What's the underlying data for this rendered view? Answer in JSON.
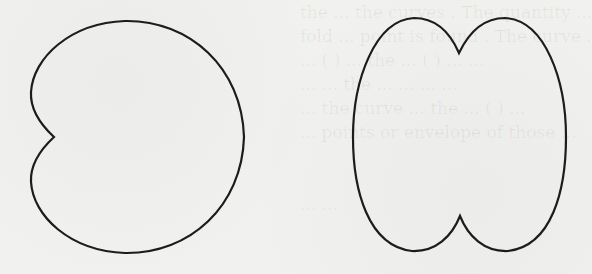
{
  "figure": {
    "background_color": "#f1f1f0",
    "stroke_color": "#1c1c1c",
    "curves": [
      {
        "name": "left-curve",
        "shape": "single inward cusp on left side (cardioid-like)",
        "cusp": [
          54,
          137
        ],
        "bounds": {
          "left": 31,
          "right": 244,
          "top": 21,
          "bottom": 253
        }
      },
      {
        "name": "right-curve",
        "shape": "oval with cusps at top and bottom (double-lobed)",
        "top_cusp": [
          459,
          53
        ],
        "bottom_cusp": [
          460,
          216
        ],
        "bounds": {
          "left": 353,
          "right": 566,
          "top": 18,
          "bottom": 251
        }
      }
    ]
  },
  "show_through_text": {
    "lines": [
      "the  ...  the curves  . The  quantity  ...",
      "fold  ...  point  is  found  .  The  curve  ...",
      "... ( ) ... the  ...  ( )  ...  ...",
      "...  ...  the  ...  ...  ...  ...",
      "...  the  curve  ...  the  ... ( ) ...",
      "...  points  or  envelope  of  those  ...",
      "",
      "",
      "...  ..."
    ]
  }
}
